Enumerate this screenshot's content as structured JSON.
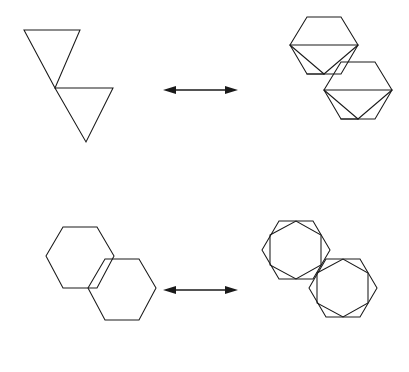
{
  "document": {
    "title": "Geometric Equivalence Diagram",
    "background_color": "#ffffff",
    "stroke_color": "#1a1a1a",
    "width": 409,
    "height": 372,
    "description": "Two rows of geometric figures; each row relates a pair of vertex-touching polygons to a subdivided version via a double-headed arrow."
  },
  "rows": [
    {
      "id": "row-triangles",
      "label": "Triangle pair equivalence",
      "left_figure": {
        "name": "triangle-pair",
        "shape_type": "triangle",
        "count": 2,
        "orientation": "point-down",
        "arrangement": "vertex-touching-diagonal",
        "shapes": [
          {
            "name": "triangle-upper-left",
            "points": "24,30 80,30 55,88"
          },
          {
            "name": "triangle-lower-right",
            "points": "55,88 113,88 86,142"
          }
        ]
      },
      "arrow": {
        "name": "equivalence-arrow-top",
        "type": "double-headed",
        "direction": "horizontal",
        "x1": 163,
        "x2": 238,
        "y": 90
      },
      "right_figure": {
        "name": "hexagon-pair-with-inscribed-triangles",
        "shape_type": "hexagon",
        "count": 2,
        "arrangement": "vertex-touching-diagonal",
        "inner_shape": "inscribed-triangle",
        "shapes": [
          {
            "name": "hexagon-upper-left",
            "points": "290,45 307,17 341,17 358,45 341,74 307,74"
          },
          {
            "name": "hexagon-lower-right",
            "points": "324,90 341,62 375,62 392,90 375,119 341,119"
          }
        ],
        "chords": [
          {
            "name": "chord-upper-horizontal",
            "x1": 290,
            "y1": 45,
            "x2": 358,
            "y2": 45
          },
          {
            "name": "chord-upper-left-to-apex",
            "x1": 290,
            "y1": 45,
            "x2": 324,
            "y2": 74
          },
          {
            "name": "chord-upper-right-to-apex",
            "x1": 358,
            "y1": 45,
            "x2": 324,
            "y2": 74
          },
          {
            "name": "chord-upper-vertex-to-apex",
            "x1": 307,
            "y1": 74,
            "x2": 324,
            "y2": 74
          },
          {
            "name": "chord-lower-horizontal",
            "x1": 324,
            "y1": 90,
            "x2": 392,
            "y2": 90
          },
          {
            "name": "chord-lower-left-to-apex",
            "x1": 324,
            "y1": 90,
            "x2": 358,
            "y2": 119
          },
          {
            "name": "chord-lower-right-to-apex",
            "x1": 392,
            "y1": 90,
            "x2": 358,
            "y2": 119
          },
          {
            "name": "chord-lower-vertex-to-apex",
            "x1": 341,
            "y1": 119,
            "x2": 358,
            "y2": 119
          }
        ]
      }
    },
    {
      "id": "row-hexagons",
      "label": "Hexagon pair equivalence",
      "left_figure": {
        "name": "hexagon-pair-plain",
        "shape_type": "hexagon",
        "count": 2,
        "arrangement": "vertex-touching-diagonal",
        "shapes": [
          {
            "name": "hexagon-plain-upper-left",
            "points": "46,256 63,227 97,227 114,256 97,288 63,288"
          },
          {
            "name": "hexagon-plain-lower-right",
            "points": "88,288 105,259 139,259 156,288 139,320 105,320"
          }
        ]
      },
      "arrow": {
        "name": "equivalence-arrow-bottom",
        "type": "double-headed",
        "direction": "horizontal",
        "x1": 163,
        "x2": 238,
        "y": 290
      },
      "right_figure": {
        "name": "hexagon-pair-with-inscribed-hexagons",
        "shape_type": "hexagon",
        "count": 2,
        "arrangement": "vertex-touching-diagonal",
        "inner_shape": "inscribed-rotated-hexagon",
        "shapes": [
          {
            "name": "hexagon-outer-upper-left",
            "points": "262,250 279,221 313,221 330,250 313,279 279,279"
          },
          {
            "name": "hexagon-inner-upper-left",
            "points": "270,235 296,221 321,235 321,265 296,279 270,265"
          },
          {
            "name": "hexagon-outer-lower-right",
            "points": "309,288 326,259 360,259 377,288 360,317 326,317"
          },
          {
            "name": "hexagon-inner-lower-right",
            "points": "317,273 343,259 368,273 368,303 343,317 317,303"
          }
        ]
      }
    }
  ]
}
